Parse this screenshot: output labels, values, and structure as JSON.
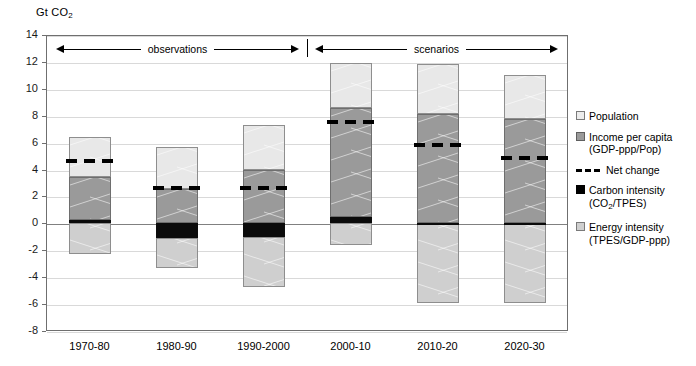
{
  "axis_title": "Gt CO",
  "axis_title_sub": "2",
  "bands": [
    {
      "label": "observations"
    },
    {
      "label": "scenarios"
    }
  ],
  "legend": [
    {
      "key": "pop",
      "label": "Population",
      "sub": ""
    },
    {
      "key": "inc",
      "label": "Income per capita",
      "sub": "(GDP-ppp/Pop)"
    },
    {
      "key": "dash",
      "label": "Net change",
      "sub": ""
    },
    {
      "key": "carb",
      "label": "Carbon intensity",
      "sub": "(CO",
      "sub2": "2",
      "sub3": "/TPES)"
    },
    {
      "key": "energy",
      "label": "Energy intensity",
      "sub": "(TPES/GDP-ppp)"
    }
  ],
  "colors": {
    "population": "#e8e8e8",
    "income": "#9a9a9a",
    "carbon": "#0b0b0b",
    "energy": "#cfcfcf",
    "net_change": "#000000",
    "grid": "#d9d9d9",
    "frame": "#6f6f6f"
  },
  "chart_data": {
    "type": "bar",
    "title": "",
    "subtitle": "",
    "xlabel": "",
    "ylabel": "Gt CO2",
    "ylim": [
      -8,
      14
    ],
    "yticks": [
      14,
      12,
      10,
      8,
      6,
      4,
      2,
      0,
      -2,
      -4,
      -6,
      -8
    ],
    "grid": true,
    "legend_position": "right",
    "stacked": true,
    "categories": [
      "1970-80",
      "1980-90",
      "1990-2000",
      "2000-10",
      "2010-20",
      "2020-30"
    ],
    "series": [
      {
        "name": "Energy intensity (TPES/GDP-ppp)",
        "values": [
          -2.3,
          -3.3,
          -4.75,
          -1.6,
          -5.9,
          -5.95
        ]
      },
      {
        "name": "Carbon intensity (CO2/TPES)",
        "values": [
          0.25,
          -1.1,
          -1.05,
          0.5,
          0.05,
          0.05
        ]
      },
      {
        "name": "Income per capita (GDP-ppp/Pop)",
        "values": [
          3.2,
          2.55,
          3.95,
          8.1,
          8.1,
          7.7
        ]
      },
      {
        "name": "Population",
        "values": [
          3.0,
          3.15,
          3.35,
          3.35,
          3.7,
          3.25
        ]
      },
      {
        "name": "Net change",
        "values": [
          4.6,
          2.65,
          2.6,
          7.55,
          5.85,
          4.85
        ]
      }
    ],
    "segment_bounds": [
      {
        "category": "1970-80",
        "energy": [
          -2.3,
          0.0
        ],
        "carbon": [
          0.0,
          0.25
        ],
        "income": [
          0.25,
          3.45
        ],
        "population": [
          3.45,
          6.45
        ],
        "net": 4.6
      },
      {
        "category": "1980-90",
        "energy": [
          -3.3,
          -1.1
        ],
        "carbon": [
          -1.1,
          0.0
        ],
        "income": [
          0.0,
          2.55
        ],
        "population": [
          2.55,
          5.7
        ],
        "net": 2.65
      },
      {
        "category": "1990-2000",
        "energy": [
          -4.75,
          -1.05
        ],
        "carbon": [
          -1.05,
          0.0
        ],
        "income": [
          0.0,
          3.95
        ],
        "population": [
          3.95,
          7.3
        ],
        "net": 2.6
      },
      {
        "category": "2000-10",
        "energy": [
          -1.6,
          0.0
        ],
        "carbon": [
          0.0,
          0.5
        ],
        "income": [
          0.5,
          8.6
        ],
        "population": [
          8.6,
          11.95
        ],
        "net": 7.55
      },
      {
        "category": "2010-20",
        "energy": [
          -5.9,
          0.0
        ],
        "carbon": [
          0.0,
          0.05
        ],
        "income": [
          0.05,
          8.15
        ],
        "population": [
          8.15,
          11.85
        ],
        "net": 5.85
      },
      {
        "category": "2020-30",
        "energy": [
          -5.95,
          0.0
        ],
        "carbon": [
          0.0,
          0.05
        ],
        "income": [
          0.05,
          7.75
        ],
        "population": [
          7.75,
          11.0
        ],
        "net": 4.85
      }
    ],
    "annotations": [
      {
        "text": "observations",
        "span": [
          "1970-80",
          "1990-2000"
        ]
      },
      {
        "text": "scenarios",
        "span": [
          "2000-10",
          "2020-30"
        ]
      }
    ]
  }
}
